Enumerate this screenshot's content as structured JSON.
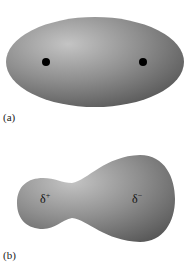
{
  "panels": [
    {
      "id": "a",
      "label": "(a)",
      "shape": "nonpolar-ellipsoid",
      "nuclei_count": 2
    },
    {
      "id": "b",
      "label": "(b)",
      "shape": "polar-electron-cloud",
      "charges": {
        "left": "δ",
        "left_sign": "+",
        "right": "δ",
        "right_sign": "−"
      }
    }
  ],
  "colors": {
    "cloud_light": "#c8c8c8",
    "cloud_mid": "#8a8a8a",
    "cloud_dark": "#555555",
    "nucleus": "#000000"
  }
}
